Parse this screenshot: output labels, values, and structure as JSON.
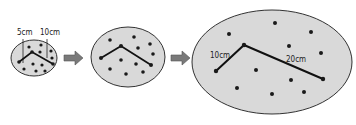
{
  "diagram": {
    "title": "",
    "stages": [
      {
        "id": "small",
        "labels": [
          {
            "text": "5cm",
            "x": 17,
            "y": 35
          },
          {
            "text": "10cm",
            "x": 41,
            "y": 35
          }
        ]
      },
      {
        "id": "medium",
        "labels": []
      },
      {
        "id": "large",
        "labels": [
          {
            "text": "10cm",
            "x": 210,
            "y": 58
          },
          {
            "text": "20cm",
            "x": 285,
            "y": 62
          }
        ]
      }
    ],
    "arrows": [
      {
        "from": "small",
        "to": "medium"
      },
      {
        "from": "medium",
        "to": "large"
      }
    ],
    "colors": {
      "fill": "#d9d9d9",
      "stroke": "#333333",
      "dot": "#1a1a1a",
      "arrow": "#7a7a7a"
    }
  }
}
